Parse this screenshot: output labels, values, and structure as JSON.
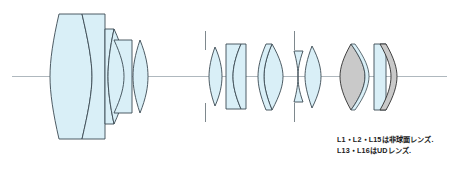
{
  "diagram": {
    "axis_label": "optical-axis",
    "colors": {
      "glass_fill": "#d9eff7",
      "glass_stroke": "#3b4a52",
      "ud_fill": "#c9c9c9",
      "ud_stroke": "#2e2e2e",
      "axis_line": "#9aa6ad",
      "stop_mark": "#6f7a80",
      "background": "#ffffff",
      "text": "#1a1a1a"
    },
    "groups": [
      {
        "name": "front-group",
        "elements": [
          "L1",
          "L2",
          "L3",
          "L4",
          "L5"
        ]
      },
      {
        "name": "middle-group",
        "elements": [
          "L6",
          "L7",
          "L8",
          "L9",
          "L10",
          "L11",
          "L12"
        ]
      },
      {
        "name": "rear-group",
        "elements": [
          "L13",
          "L14",
          "L15",
          "L16"
        ]
      }
    ],
    "aperture_stops": 2
  },
  "caption": {
    "line1": "L1・L2・L15は非球面レンズ.",
    "line2": "L13・L16はUDレンズ."
  }
}
